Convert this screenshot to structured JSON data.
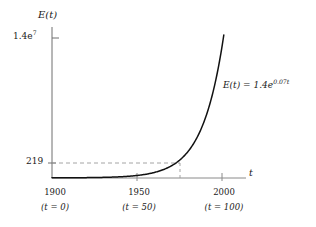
{
  "chart_data": {
    "type": "line",
    "title": "",
    "xlabel": "t",
    "ylabel": "E(t)",
    "equation_label": "E(t) = 1.4e",
    "equation_exponent": "0.07t",
    "function": "E(t) = 1.4e^(0.07t)",
    "coefficient": 1.4,
    "rate": 0.07,
    "xlim": [
      0,
      118
    ],
    "ylim": [
      0,
      14000000
    ],
    "grid": false,
    "legend": "none",
    "x_ticks": [
      {
        "year": "1900",
        "sub": "(t = 0)",
        "t": 0
      },
      {
        "year": "1950",
        "sub": "(t = 50)",
        "t": 50
      },
      {
        "year": "2000",
        "sub": "(t = 100)",
        "t": 100
      }
    ],
    "y_ticks": [
      {
        "label_mantissa": "1.4e",
        "label_exponent": "7",
        "value": 14000000
      },
      {
        "label_mantissa": "219",
        "label_exponent": "",
        "value": 219
      }
    ],
    "annotations": [
      {
        "name": "dashed-horizontal-guide",
        "y_value": 219,
        "note": "horizontal dashed line at E = 219"
      },
      {
        "name": "dashed-vertical-guide",
        "t_value": 72,
        "note": "vertical dashed drop line from curve to t axis"
      }
    ],
    "series": [
      {
        "name": "E(t) = 1.4e^(0.07t)",
        "x": [
          0,
          10,
          20,
          30,
          40,
          50,
          60,
          70,
          72,
          80,
          90,
          100,
          110,
          116
        ],
        "y": [
          1.4,
          2.8,
          5.7,
          11.4,
          23.0,
          46.3,
          93.3,
          188.0,
          216.1,
          378.7,
          762.6,
          1535.9,
          3093.1,
          4706.9
        ],
        "y_true": [
          1.4,
          2.82,
          5.68,
          11.43,
          23.02,
          46.35,
          93.32,
          187.91,
          216.06,
          378.36,
          761.99,
          1534.4,
          3089.9,
          4702.1
        ]
      }
    ]
  },
  "axes": {
    "y_axis_name": "vertical-axis",
    "x_axis_name": "horizontal-axis"
  }
}
